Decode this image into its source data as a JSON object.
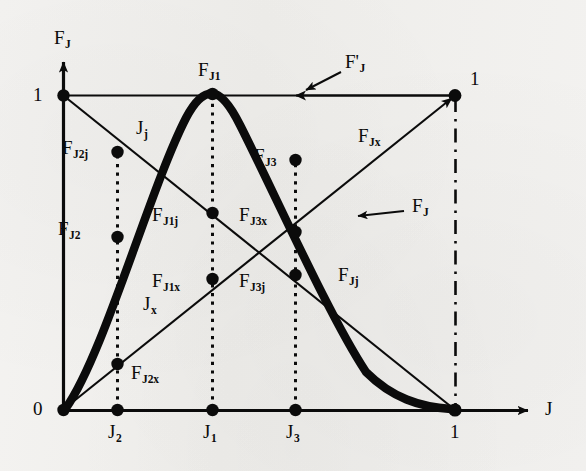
{
  "figure": {
    "type": "diagram",
    "background_color": "#f2f1ef",
    "ink_color": "#0b0b0b",
    "axes": {
      "y_axis_label": "F",
      "y_axis_label_sub": "J",
      "x_axis_label": "J",
      "origin_label": "0",
      "y_top_tick_label": "1",
      "x_right_tick_label": "1",
      "corner_tick_label": "1",
      "origin_px": {
        "x": 63,
        "y": 410
      },
      "unit_px": {
        "x": 455,
        "y": 95
      }
    },
    "x_ticks": [
      {
        "label": "J",
        "sub": "2",
        "x_px": 117
      },
      {
        "label": "J",
        "sub": "1",
        "x_px": 212
      },
      {
        "label": "J",
        "sub": "3",
        "x_px": 295
      },
      {
        "label": "1",
        "sub": "",
        "x_px": 455
      }
    ],
    "curves": [
      {
        "name": "F_J",
        "style": "thick-bold",
        "label": "F",
        "label_sub": "J",
        "note": "bold concave membership curve peaking at J1 with value 1, starting at origin, ending at (1,0)"
      },
      {
        "name": "F_prime_J",
        "style": "thin-horizontal",
        "label": "F'",
        "label_sub": "J",
        "note": "horizontal line at F_J = 1 from y-axis to (1,1), arrowhead pointing left"
      },
      {
        "name": "J_x",
        "style": "thin-rising",
        "label": "J",
        "label_sub": "x",
        "note": "rising straight line from origin (0,0) to (1,1) with arrowhead at top right"
      },
      {
        "name": "J_j",
        "style": "thin-falling",
        "label": "J",
        "label_sub": "j",
        "note": "falling straight line from (0,1) to (1,0)"
      }
    ],
    "points": [
      {
        "name": "F_J1",
        "label": "F",
        "sub": "J1",
        "x_px": 212,
        "y_px": 95,
        "label_x": 198,
        "label_y": 60
      },
      {
        "name": "F_J2j",
        "label": "F",
        "sub": "J2j",
        "x_px": 117,
        "y_px": 152,
        "label_x": 62,
        "label_y": 138
      },
      {
        "name": "F_J2",
        "label": "F",
        "sub": "J2",
        "x_px": 117,
        "y_px": 237,
        "label_x": 58,
        "label_y": 219
      },
      {
        "name": "F_J3",
        "label": "F",
        "sub": "J3",
        "x_px": 295,
        "y_px": 160,
        "label_x": 254,
        "label_y": 146
      },
      {
        "name": "F_J1j",
        "label": "F",
        "sub": "J1j",
        "x_px": 212,
        "y_px": 213,
        "label_x": 152,
        "label_y": 205
      },
      {
        "name": "F_J3x",
        "label": "F",
        "sub": "J3x",
        "x_px": 295,
        "y_px": 232,
        "label_x": 239,
        "label_y": 205
      },
      {
        "name": "F_J1x",
        "label": "F",
        "sub": "J1x",
        "x_px": 212,
        "y_px": 279,
        "label_x": 152,
        "label_y": 271
      },
      {
        "name": "F_J3j",
        "label": "F",
        "sub": "J3j",
        "x_px": 295,
        "y_px": 275,
        "label_x": 239,
        "label_y": 271
      },
      {
        "name": "F_J2x",
        "label": "F",
        "sub": "J2x",
        "x_px": 117,
        "y_px": 364,
        "label_x": 131,
        "label_y": 363
      }
    ],
    "annotations": [
      {
        "name": "F_prime_J_callout",
        "label": "F'",
        "sub": "J",
        "x_px": 345,
        "y_px": 62
      },
      {
        "name": "F_J_callout",
        "label": "F",
        "sub": "J",
        "x_px": 412,
        "y_px": 203
      },
      {
        "name": "F_Jx_label",
        "label": "F",
        "sub": "Jx",
        "x_px": 358,
        "y_px": 130
      },
      {
        "name": "F_Jj_label",
        "label": "F",
        "sub": "Jj",
        "x_px": 338,
        "y_px": 272
      },
      {
        "name": "J_j_label",
        "label": "J",
        "sub": "j",
        "x_px": 136,
        "y_px": 124
      },
      {
        "name": "J_x_label",
        "label": "J",
        "sub": "x",
        "x_px": 143,
        "y_px": 300
      }
    ]
  }
}
